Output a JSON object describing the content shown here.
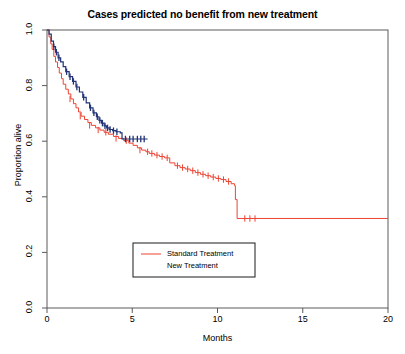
{
  "chart_data": {
    "type": "line",
    "title": "Cases predicted no benefit from new treatment",
    "xlabel": "Months",
    "ylabel": "Proportion alive",
    "xlim": [
      0,
      20
    ],
    "ylim": [
      0,
      1
    ],
    "xticks": [
      0,
      5,
      10,
      15,
      20
    ],
    "xtick_labels": [
      "0",
      "5",
      "10",
      "15",
      "20"
    ],
    "yticks": [
      0.0,
      0.2,
      0.4,
      0.6,
      0.8,
      1.0
    ],
    "ytick_labels": [
      "0.0",
      "0.2",
      "0.4",
      "0.6",
      "0.8",
      "1.0"
    ],
    "grid": false,
    "legend_position": "bottom-center",
    "series": [
      {
        "name": "Standard Treatment",
        "color": "#ee4433",
        "steps": [
          [
            0.0,
            1.0
          ],
          [
            0.12,
            0.975
          ],
          [
            0.22,
            0.95
          ],
          [
            0.3,
            0.93
          ],
          [
            0.4,
            0.905
          ],
          [
            0.5,
            0.885
          ],
          [
            0.62,
            0.865
          ],
          [
            0.72,
            0.845
          ],
          [
            0.85,
            0.825
          ],
          [
            0.95,
            0.805
          ],
          [
            1.1,
            0.787
          ],
          [
            1.25,
            0.77
          ],
          [
            1.4,
            0.752
          ],
          [
            1.55,
            0.735
          ],
          [
            1.7,
            0.72
          ],
          [
            1.85,
            0.705
          ],
          [
            2.0,
            0.69
          ],
          [
            2.2,
            0.678
          ],
          [
            2.4,
            0.667
          ],
          [
            2.6,
            0.657
          ],
          [
            2.85,
            0.648
          ],
          [
            3.1,
            0.64
          ],
          [
            3.35,
            0.632
          ],
          [
            3.6,
            0.625
          ],
          [
            3.9,
            0.617
          ],
          [
            4.2,
            0.61
          ],
          [
            4.5,
            0.602
          ],
          [
            4.8,
            0.593
          ],
          [
            5.05,
            0.585
          ],
          [
            5.3,
            0.576
          ],
          [
            5.55,
            0.568
          ],
          [
            5.8,
            0.562
          ],
          [
            6.0,
            0.556
          ],
          [
            6.3,
            0.55
          ],
          [
            6.6,
            0.545
          ],
          [
            6.9,
            0.54
          ],
          [
            7.2,
            0.522
          ],
          [
            7.5,
            0.512
          ],
          [
            7.8,
            0.505
          ],
          [
            8.1,
            0.5
          ],
          [
            8.4,
            0.494
          ],
          [
            8.7,
            0.487
          ],
          [
            9.0,
            0.481
          ],
          [
            9.3,
            0.476
          ],
          [
            9.6,
            0.471
          ],
          [
            9.9,
            0.466
          ],
          [
            10.2,
            0.462
          ],
          [
            10.5,
            0.455
          ],
          [
            10.8,
            0.447
          ],
          [
            11.0,
            0.44
          ],
          [
            11.05,
            0.39
          ],
          [
            11.15,
            0.322
          ],
          [
            20.0,
            0.322
          ]
        ],
        "censored": [
          [
            1.35,
            0.752
          ],
          [
            1.95,
            0.69
          ],
          [
            2.5,
            0.657
          ],
          [
            3.0,
            0.64
          ],
          [
            3.45,
            0.632
          ],
          [
            4.05,
            0.61
          ],
          [
            4.65,
            0.602
          ],
          [
            5.45,
            0.568
          ],
          [
            5.9,
            0.562
          ],
          [
            6.15,
            0.556
          ],
          [
            6.45,
            0.55
          ],
          [
            6.75,
            0.545
          ],
          [
            7.05,
            0.54
          ],
          [
            7.65,
            0.512
          ],
          [
            7.95,
            0.505
          ],
          [
            8.25,
            0.5
          ],
          [
            8.55,
            0.494
          ],
          [
            8.85,
            0.487
          ],
          [
            9.15,
            0.481
          ],
          [
            9.45,
            0.476
          ],
          [
            9.75,
            0.471
          ],
          [
            10.05,
            0.466
          ],
          [
            10.35,
            0.462
          ],
          [
            10.65,
            0.455
          ],
          [
            11.6,
            0.322
          ],
          [
            11.9,
            0.322
          ],
          [
            12.2,
            0.322
          ]
        ],
        "plateau_value": 0.32,
        "max_followup": 20.0
      },
      {
        "name": "New Treatment",
        "color": "#223377",
        "steps": [
          [
            0.0,
            1.0
          ],
          [
            0.12,
            0.985
          ],
          [
            0.25,
            0.96
          ],
          [
            0.38,
            0.94
          ],
          [
            0.5,
            0.92
          ],
          [
            0.65,
            0.9
          ],
          [
            0.8,
            0.885
          ],
          [
            0.95,
            0.868
          ],
          [
            1.1,
            0.85
          ],
          [
            1.3,
            0.832
          ],
          [
            1.5,
            0.815
          ],
          [
            1.7,
            0.795
          ],
          [
            1.9,
            0.777
          ],
          [
            2.1,
            0.758
          ],
          [
            2.3,
            0.738
          ],
          [
            2.5,
            0.72
          ],
          [
            2.7,
            0.702
          ],
          [
            2.9,
            0.688
          ],
          [
            3.05,
            0.675
          ],
          [
            3.2,
            0.665
          ],
          [
            3.35,
            0.655
          ],
          [
            3.5,
            0.648
          ],
          [
            3.65,
            0.642
          ],
          [
            3.85,
            0.638
          ],
          [
            4.05,
            0.634
          ],
          [
            4.3,
            0.63
          ],
          [
            4.4,
            0.608
          ],
          [
            5.9,
            0.608
          ]
        ],
        "censored": [
          [
            0.4,
            0.94
          ],
          [
            0.55,
            0.92
          ],
          [
            0.7,
            0.9
          ],
          [
            1.15,
            0.85
          ],
          [
            1.35,
            0.832
          ],
          [
            1.55,
            0.815
          ],
          [
            1.75,
            0.795
          ],
          [
            2.15,
            0.758
          ],
          [
            2.55,
            0.72
          ],
          [
            2.75,
            0.702
          ],
          [
            2.95,
            0.688
          ],
          [
            3.1,
            0.675
          ],
          [
            3.25,
            0.665
          ],
          [
            3.4,
            0.655
          ],
          [
            3.55,
            0.648
          ],
          [
            3.7,
            0.642
          ],
          [
            3.9,
            0.638
          ],
          [
            4.1,
            0.634
          ],
          [
            4.6,
            0.608
          ],
          [
            4.85,
            0.608
          ],
          [
            5.05,
            0.608
          ],
          [
            5.3,
            0.608
          ],
          [
            5.5,
            0.608
          ],
          [
            5.7,
            0.608
          ]
        ],
        "plateau_value": 0.61,
        "max_followup": 5.9
      }
    ]
  },
  "legend": {
    "entries": [
      {
        "label": "Standard Treatment",
        "color": "#ee4433",
        "show_line": true
      },
      {
        "label": "New Treatment",
        "color": "#223377",
        "show_line": false
      }
    ]
  }
}
